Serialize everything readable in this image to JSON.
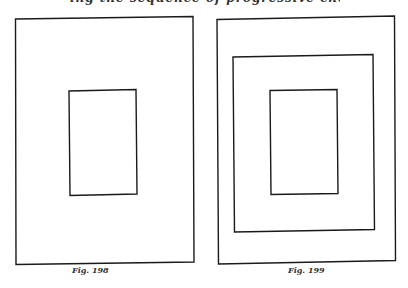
{
  "header": {
    "cut_text": "ing the sequence of progressive change"
  },
  "figures": [
    {
      "caption": "Fig. 198",
      "boxes": [
        {
          "name": "outer",
          "x": 15,
          "y": 18,
          "w": 178,
          "h": 246
        },
        {
          "name": "inner",
          "x": 69,
          "y": 90,
          "w": 68,
          "h": 105
        }
      ]
    },
    {
      "caption": "Fig. 199",
      "boxes": [
        {
          "name": "outer",
          "x": 217,
          "y": 17,
          "w": 178,
          "h": 246
        },
        {
          "name": "middle",
          "x": 233,
          "y": 55,
          "w": 141,
          "h": 176
        },
        {
          "name": "inner",
          "x": 270,
          "y": 90,
          "w": 68,
          "h": 105
        }
      ]
    }
  ],
  "colors": {
    "line": "#1a1a1a",
    "background": "#ffffff"
  }
}
